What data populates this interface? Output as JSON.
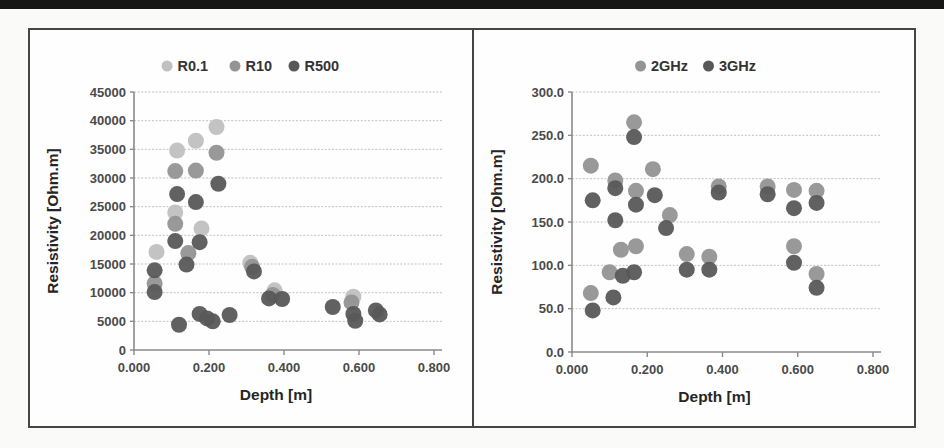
{
  "page": {
    "background_color": "#fafaf8",
    "scan_bar_color": "#161616",
    "panel_border_color": "#454545",
    "panel_background_color": "#fefefe"
  },
  "style": {
    "grid_color": "#c0c0c0",
    "axis_color": "#8a8a8a",
    "tick_text_color": "#4a4a4a",
    "title_text_color": "#252525",
    "legend_text_color": "#333333"
  },
  "chart_data": [
    {
      "id": "resistivity-vs-depth-resolution",
      "type": "scatter",
      "title": "",
      "xlabel": "Depth [m]",
      "ylabel": "Resistivity [Ohm.m]",
      "xlim": [
        0.0,
        0.8
      ],
      "ylim": [
        0,
        45000
      ],
      "grid": "horizontal",
      "legend_position": "top-center",
      "xticks": [
        {
          "v": 0.0,
          "label": "0.000"
        },
        {
          "v": 0.2,
          "label": "0.200"
        },
        {
          "v": 0.4,
          "label": "0.400"
        },
        {
          "v": 0.6,
          "label": "0.600"
        },
        {
          "v": 0.8,
          "label": "0.800"
        }
      ],
      "yticks": [
        {
          "v": 0,
          "label": "0"
        },
        {
          "v": 5000,
          "label": "5000"
        },
        {
          "v": 10000,
          "label": "10000"
        },
        {
          "v": 15000,
          "label": "15000"
        },
        {
          "v": 20000,
          "label": "20000"
        },
        {
          "v": 25000,
          "label": "25000"
        },
        {
          "v": 30000,
          "label": "30000"
        },
        {
          "v": 35000,
          "label": "35000"
        },
        {
          "v": 40000,
          "label": "40000"
        },
        {
          "v": 45000,
          "label": "45000"
        }
      ],
      "series": [
        {
          "name": "R0.1",
          "color": "#c0c0c0",
          "points": [
            [
              0.06,
              17100
            ],
            [
              0.11,
              24000
            ],
            [
              0.115,
              34800
            ],
            [
              0.165,
              36500
            ],
            [
              0.18,
              21200
            ],
            [
              0.22,
              38900
            ],
            [
              0.31,
              15200
            ],
            [
              0.375,
              10400
            ],
            [
              0.585,
              9300
            ]
          ]
        },
        {
          "name": "R10",
          "color": "#949494",
          "points": [
            [
              0.055,
              11600
            ],
            [
              0.11,
              31200
            ],
            [
              0.11,
              22000
            ],
            [
              0.145,
              16900
            ],
            [
              0.165,
              31300
            ],
            [
              0.22,
              34400
            ],
            [
              0.315,
              14500
            ],
            [
              0.37,
              9600
            ],
            [
              0.58,
              8300
            ]
          ]
        },
        {
          "name": "R500",
          "color": "#585858",
          "points": [
            [
              0.055,
              13900
            ],
            [
              0.055,
              10100
            ],
            [
              0.11,
              19000
            ],
            [
              0.115,
              27200
            ],
            [
              0.12,
              4400
            ],
            [
              0.14,
              14900
            ],
            [
              0.165,
              25800
            ],
            [
              0.175,
              18800
            ],
            [
              0.175,
              6300
            ],
            [
              0.195,
              5500
            ],
            [
              0.21,
              5000
            ],
            [
              0.225,
              29000
            ],
            [
              0.255,
              6100
            ],
            [
              0.32,
              13700
            ],
            [
              0.36,
              9000
            ],
            [
              0.395,
              8900
            ],
            [
              0.53,
              7500
            ],
            [
              0.585,
              6300
            ],
            [
              0.59,
              5100
            ],
            [
              0.645,
              6900
            ],
            [
              0.655,
              6200
            ]
          ]
        }
      ]
    },
    {
      "id": "resistivity-vs-depth-frequency",
      "type": "scatter",
      "title": "",
      "xlabel": "Depth [m]",
      "ylabel": "Resistivity [Ohm.m]",
      "xlim": [
        0.0,
        0.8
      ],
      "ylim": [
        0,
        300
      ],
      "grid": "horizontal",
      "legend_position": "top-center",
      "xticks": [
        {
          "v": 0.0,
          "label": "0.000"
        },
        {
          "v": 0.2,
          "label": "0.200"
        },
        {
          "v": 0.4,
          "label": "0.400"
        },
        {
          "v": 0.6,
          "label": "0.600"
        },
        {
          "v": 0.8,
          "label": "0.800"
        }
      ],
      "yticks": [
        {
          "v": 0,
          "label": "0.0"
        },
        {
          "v": 50,
          "label": "50.0"
        },
        {
          "v": 100,
          "label": "100.0"
        },
        {
          "v": 150,
          "label": "150.0"
        },
        {
          "v": 200,
          "label": "200.0"
        },
        {
          "v": 250,
          "label": "250.0"
        },
        {
          "v": 300,
          "label": "300.0"
        }
      ],
      "series": [
        {
          "name": "2GHz",
          "color": "#949494",
          "points": [
            [
              0.05,
              215
            ],
            [
              0.05,
              68
            ],
            [
              0.1,
              92
            ],
            [
              0.115,
              198
            ],
            [
              0.13,
              118
            ],
            [
              0.165,
              265
            ],
            [
              0.17,
              186
            ],
            [
              0.17,
              122
            ],
            [
              0.215,
              211
            ],
            [
              0.26,
              158
            ],
            [
              0.305,
              113
            ],
            [
              0.365,
              110
            ],
            [
              0.39,
              191
            ],
            [
              0.52,
              191
            ],
            [
              0.59,
              187
            ],
            [
              0.59,
              122
            ],
            [
              0.65,
              186
            ],
            [
              0.65,
              90
            ]
          ]
        },
        {
          "name": "3GHz",
          "color": "#585858",
          "points": [
            [
              0.055,
              175
            ],
            [
              0.055,
              48
            ],
            [
              0.11,
              63
            ],
            [
              0.115,
              189
            ],
            [
              0.115,
              152
            ],
            [
              0.135,
              88
            ],
            [
              0.165,
              248
            ],
            [
              0.165,
              92
            ],
            [
              0.17,
              170
            ],
            [
              0.22,
              181
            ],
            [
              0.25,
              143
            ],
            [
              0.305,
              95
            ],
            [
              0.365,
              95
            ],
            [
              0.39,
              184
            ],
            [
              0.52,
              182
            ],
            [
              0.59,
              166
            ],
            [
              0.59,
              103
            ],
            [
              0.65,
              172
            ],
            [
              0.65,
              74
            ]
          ]
        }
      ]
    }
  ]
}
